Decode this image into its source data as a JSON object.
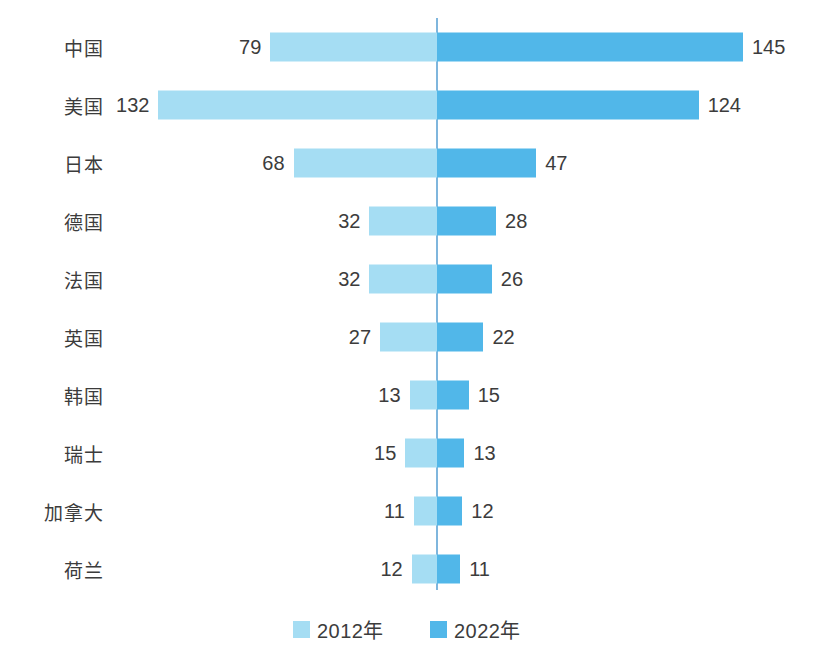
{
  "chart_data": {
    "type": "bar",
    "subtype": "diverging-butterfly",
    "title": "",
    "xlabel": "",
    "ylabel": "",
    "grid": false,
    "legend_position": "bottom-center",
    "categories": [
      "中国",
      "美国",
      "日本",
      "德国",
      "法国",
      "英国",
      "韩国",
      "瑞士",
      "加拿大",
      "荷兰"
    ],
    "series": [
      {
        "name": "2012年",
        "color": "#a5ddf3",
        "direction": "left",
        "values": [
          79,
          132,
          68,
          32,
          32,
          27,
          13,
          15,
          11,
          12
        ]
      },
      {
        "name": "2022年",
        "color": "#51b7e9",
        "direction": "right",
        "values": [
          145,
          124,
          47,
          28,
          26,
          22,
          15,
          13,
          12,
          11
        ]
      }
    ],
    "xlim": [
      0,
      145
    ],
    "units_per_pixel": 0.474
  },
  "legend": {
    "items": [
      {
        "label": "2012年",
        "color": "#a5ddf3"
      },
      {
        "label": "2022年",
        "color": "#51b7e9"
      }
    ]
  },
  "axis": {
    "center_color": "#7fb6dd"
  },
  "rows": [
    {
      "category": "中国",
      "left_value": "79",
      "right_value": "145"
    },
    {
      "category": "美国",
      "left_value": "132",
      "right_value": "124"
    },
    {
      "category": "日本",
      "left_value": "68",
      "right_value": "47"
    },
    {
      "category": "德国",
      "left_value": "32",
      "right_value": "28"
    },
    {
      "category": "法国",
      "left_value": "32",
      "right_value": "26"
    },
    {
      "category": "英国",
      "left_value": "27",
      "right_value": "22"
    },
    {
      "category": "韩国",
      "left_value": "13",
      "right_value": "15"
    },
    {
      "category": "瑞士",
      "left_value": "15",
      "right_value": "13"
    },
    {
      "category": "加拿大",
      "left_value": "11",
      "right_value": "12"
    },
    {
      "category": "荷兰",
      "left_value": "12",
      "right_value": "11"
    }
  ]
}
